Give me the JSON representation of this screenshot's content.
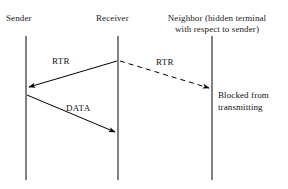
{
  "diagram": {
    "background_color": "#ffffff",
    "line_color": "#4d4d4d",
    "arrow_color": "#000000",
    "text_color": "#111111"
  },
  "headers": {
    "sender": "Sender",
    "receiver": "Receiver",
    "neighbor_line1": "Neighbor (hidden terminal",
    "neighbor_line2": "with respect to sender)"
  },
  "messages": {
    "rtr_to_sender": "RTR",
    "rtr_to_neighbor": "RTR",
    "data": "DATA"
  },
  "notes": {
    "blocked_line1": "Blocked from",
    "blocked_line2": "transmitting"
  }
}
